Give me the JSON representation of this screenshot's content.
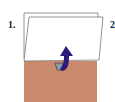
{
  "diagram": {
    "step1_label": "1.",
    "step2_label": "2",
    "pocket_color": "#c98a6c",
    "arrow_color": "#2a1a7a",
    "card_color": "#ffffff",
    "outline_color": "#777777"
  }
}
